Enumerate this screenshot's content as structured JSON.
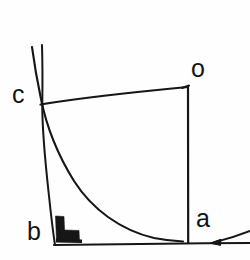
{
  "figure": {
    "background_color": "#fefefe",
    "ink_color": "#141414",
    "width": 250,
    "height": 260,
    "labels": {
      "o": "o",
      "c": "c",
      "a": "a",
      "b": "b"
    },
    "points": {
      "o": {
        "x": 188,
        "y": 86,
        "label": "o"
      },
      "c": {
        "x": 40,
        "y": 103,
        "label": "c"
      },
      "a": {
        "x": 188,
        "y": 241,
        "label": "a"
      },
      "b": {
        "x": 55,
        "y": 244,
        "label": "b"
      }
    },
    "segments": [
      {
        "name": "chord-c-o",
        "from": "c",
        "to": "o"
      },
      {
        "name": "vertical-o-a",
        "from": "o",
        "to": "a"
      },
      {
        "name": "baseline-b-right",
        "from": "b",
        "to": "right-edge"
      },
      {
        "name": "steep-line-c-b",
        "from": "c",
        "to": "b"
      }
    ],
    "curves": [
      {
        "name": "descent-curve",
        "from": "c-upper-extension",
        "to": "baseline-tangent"
      }
    ],
    "markers": [
      {
        "name": "right-angle-marker",
        "x": 58,
        "y": 228,
        "style": "solid-black-corner"
      },
      {
        "name": "direction-arrowhead",
        "x": 214,
        "y": 243,
        "direction": "left"
      }
    ]
  }
}
